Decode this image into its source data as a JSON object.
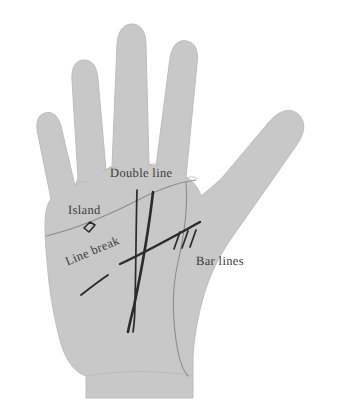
{
  "figure": {
    "name": "palmistry-hand-diagram",
    "background_color": "#ffffff",
    "hand_fill_color": "#c8c8c8",
    "hand_edge_color": "#b5b5b5",
    "palm_line_color": "#8a8a8a",
    "marking_color": "#2b2b2b",
    "label_color": "#3a3a3a"
  },
  "labels": {
    "double_line": "Double line",
    "island": "Island",
    "line_break": "Line break",
    "bar_lines": "Bar lines"
  },
  "markings": [
    {
      "name": "double-line",
      "label": "Double line",
      "description": "two near-parallel dark strokes crossing the palm vertically"
    },
    {
      "name": "island",
      "label": "Island",
      "description": "small closed lozenge shape formed within a palm line"
    },
    {
      "name": "line-break",
      "label": "Line break",
      "description": "a palm line interrupted by a gap"
    },
    {
      "name": "bar-lines",
      "label": "Bar lines",
      "description": "three short strokes crossing a palm line"
    }
  ],
  "palm_lines": [
    {
      "name": "heart-line",
      "description": "long thin curve sweeping up from the lower left palm edge toward the index side"
    },
    {
      "name": "fate-line",
      "description": "long vertical line running from below the middle finger down to the wrist"
    },
    {
      "name": "life-line",
      "description": "thin curve arcing around the thumb ball down to the wrist"
    }
  ]
}
